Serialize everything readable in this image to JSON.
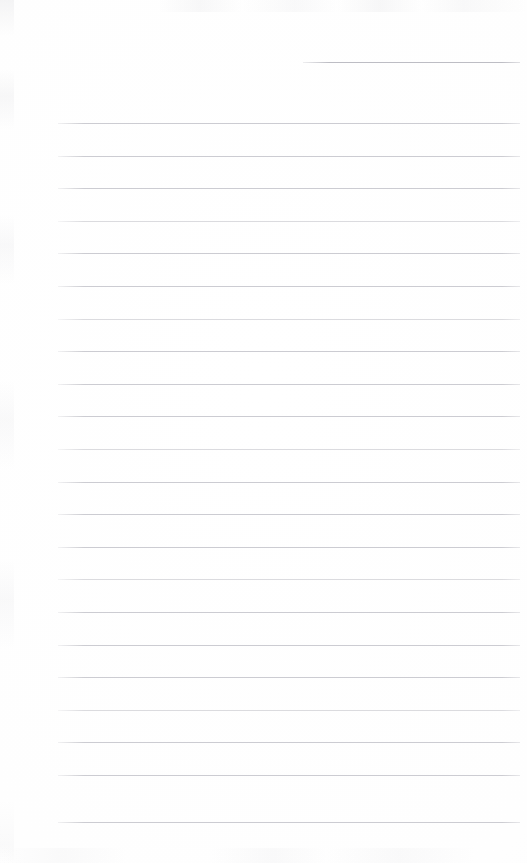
{
  "page": {
    "kind": "blank-lined-notebook-page",
    "width": 527,
    "height": 863,
    "background_color": "#fefefe",
    "has_text": false,
    "has_handwriting": false,
    "visible_text": "",
    "note": "Scanned blank ruled notebook page. No text, headings, icons or controls are rendered in the pixels."
  },
  "ruling": {
    "line_color": "#c6c6cc",
    "line_thickness_px": 1,
    "line_spacing_px": 32.6,
    "margin_left_px": 58,
    "margin_right_px": 520,
    "first_full_line_y_px": 123,
    "last_line_y_px": 822,
    "full_line_count": 22,
    "short_line_count": 1,
    "total_line_count": 23
  },
  "lines": [
    {
      "id": "rule-00",
      "y": 62,
      "x1": 303,
      "x2": 520,
      "weight": "strong",
      "kind": "short"
    },
    {
      "id": "rule-01",
      "y": 123,
      "x1": 58,
      "x2": 520,
      "weight": "normal",
      "kind": "full"
    },
    {
      "id": "rule-02",
      "y": 155.6,
      "x1": 58,
      "x2": 520,
      "weight": "normal",
      "kind": "full"
    },
    {
      "id": "rule-03",
      "y": 188.2,
      "x1": 58,
      "x2": 520,
      "weight": "normal",
      "kind": "full"
    },
    {
      "id": "rule-04",
      "y": 220.8,
      "x1": 58,
      "x2": 520,
      "weight": "faint",
      "kind": "full"
    },
    {
      "id": "rule-05",
      "y": 253.4,
      "x1": 58,
      "x2": 520,
      "weight": "normal",
      "kind": "full"
    },
    {
      "id": "rule-06",
      "y": 286.0,
      "x1": 58,
      "x2": 520,
      "weight": "normal",
      "kind": "full"
    },
    {
      "id": "rule-07",
      "y": 318.6,
      "x1": 58,
      "x2": 520,
      "weight": "faint",
      "kind": "full"
    },
    {
      "id": "rule-08",
      "y": 351.2,
      "x1": 58,
      "x2": 520,
      "weight": "normal",
      "kind": "full"
    },
    {
      "id": "rule-09",
      "y": 383.8,
      "x1": 58,
      "x2": 520,
      "weight": "normal",
      "kind": "full"
    },
    {
      "id": "rule-10",
      "y": 416.4,
      "x1": 58,
      "x2": 520,
      "weight": "normal",
      "kind": "full"
    },
    {
      "id": "rule-11",
      "y": 449.0,
      "x1": 58,
      "x2": 520,
      "weight": "faint",
      "kind": "full"
    },
    {
      "id": "rule-12",
      "y": 481.6,
      "x1": 58,
      "x2": 520,
      "weight": "normal",
      "kind": "full"
    },
    {
      "id": "rule-13",
      "y": 514.2,
      "x1": 58,
      "x2": 520,
      "weight": "normal",
      "kind": "full"
    },
    {
      "id": "rule-14",
      "y": 546.8,
      "x1": 58,
      "x2": 520,
      "weight": "normal",
      "kind": "full"
    },
    {
      "id": "rule-15",
      "y": 579.4,
      "x1": 58,
      "x2": 520,
      "weight": "faint",
      "kind": "full"
    },
    {
      "id": "rule-16",
      "y": 612.0,
      "x1": 58,
      "x2": 520,
      "weight": "normal",
      "kind": "full"
    },
    {
      "id": "rule-17",
      "y": 644.6,
      "x1": 58,
      "x2": 520,
      "weight": "normal",
      "kind": "full"
    },
    {
      "id": "rule-18",
      "y": 677.2,
      "x1": 58,
      "x2": 520,
      "weight": "normal",
      "kind": "full"
    },
    {
      "id": "rule-19",
      "y": 709.8,
      "x1": 58,
      "x2": 520,
      "weight": "faint",
      "kind": "full"
    },
    {
      "id": "rule-20",
      "y": 742.4,
      "x1": 58,
      "x2": 520,
      "weight": "normal",
      "kind": "full"
    },
    {
      "id": "rule-21",
      "y": 775.0,
      "x1": 58,
      "x2": 520,
      "weight": "normal",
      "kind": "full"
    },
    {
      "id": "rule-22",
      "y": 822.0,
      "x1": 58,
      "x2": 520,
      "weight": "normal",
      "kind": "full"
    }
  ]
}
